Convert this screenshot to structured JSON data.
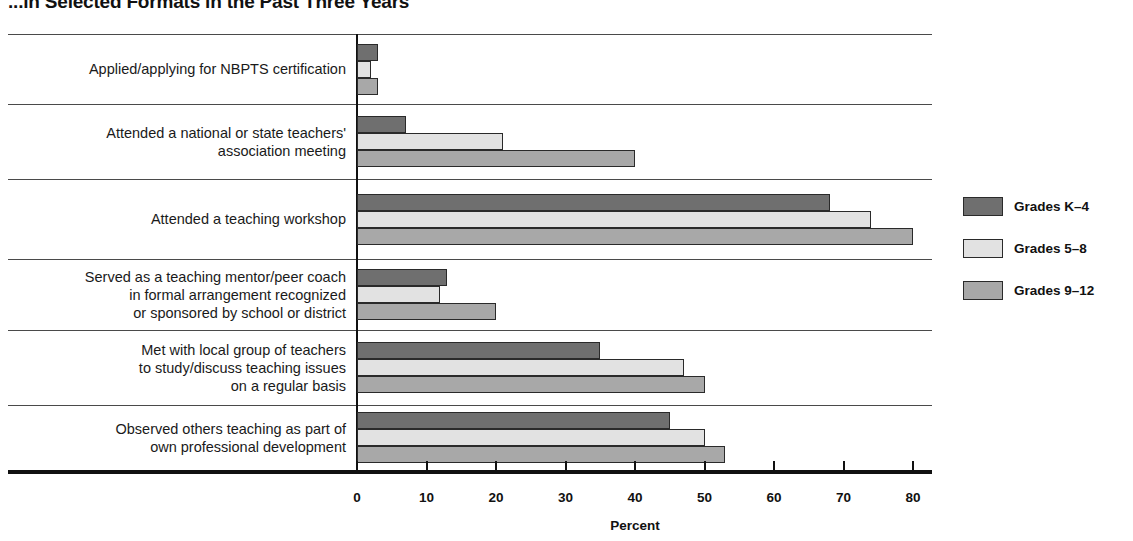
{
  "chart_data": {
    "type": "bar",
    "orientation": "horizontal",
    "title": "...in Selected Formats in the Past Three Years",
    "xlabel": "Percent",
    "ylabel": "",
    "xlim": [
      0,
      80
    ],
    "xticks": [
      0,
      10,
      20,
      30,
      40,
      50,
      60,
      70,
      80
    ],
    "xtick_labels": [
      "0",
      "10",
      "20",
      "30",
      "40",
      "50",
      "60",
      "70",
      "80"
    ],
    "grid": false,
    "legend_position": "right",
    "categories": [
      "Applied/applying for NBPTS certification",
      "Attended a national or state teachers' association meeting",
      "Attended a teaching workshop",
      "Served as a teaching mentor/peer coach in formal arrangement recognized or sponsored by school or district",
      "Met with local group of teachers to study/discuss teaching issues on a regular basis",
      "Observed others teaching as part of own professional development"
    ],
    "category_lines": [
      [
        "Applied/applying for NBPTS certification"
      ],
      [
        "Attended a national or state teachers'",
        "association meeting"
      ],
      [
        "Attended a teaching workshop"
      ],
      [
        "Served as a teaching mentor/peer coach",
        "in formal arrangement recognized",
        "or sponsored by school or district"
      ],
      [
        "Met with local group of teachers",
        "to study/discuss teaching issues",
        "on a regular basis"
      ],
      [
        "Observed others teaching as part of",
        "own professional development"
      ]
    ],
    "series": [
      {
        "name": "Grades K–4",
        "color": "#6f6f6f",
        "values": [
          3,
          7,
          68,
          13,
          35,
          45
        ]
      },
      {
        "name": "Grades 5–8",
        "color": "#e2e2e2",
        "values": [
          2,
          21,
          74,
          12,
          47,
          50
        ]
      },
      {
        "name": "Grades 9–12",
        "color": "#a8a8a8",
        "values": [
          3,
          40,
          80,
          20,
          50,
          53
        ]
      }
    ]
  },
  "legend": {
    "items": [
      {
        "label": "Grades K–4",
        "color": "#6f6f6f"
      },
      {
        "label": "Grades 5–8",
        "color": "#e2e2e2"
      },
      {
        "label": "Grades 9–12",
        "color": "#a8a8a8"
      }
    ]
  }
}
